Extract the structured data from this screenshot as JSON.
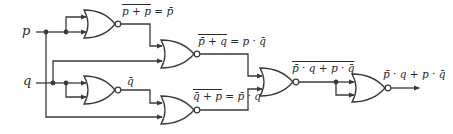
{
  "diagram": {
    "type": "logic-circuit",
    "gate_type": "NOR",
    "inputs": [
      {
        "id": "p",
        "label": "p"
      },
      {
        "id": "q",
        "label": "q"
      }
    ],
    "gates": [
      {
        "id": "g1",
        "label_overbar": "p + p",
        "label_rest": " = p̄",
        "inputs": [
          "p",
          "p"
        ]
      },
      {
        "id": "g3",
        "label_overbar": "",
        "label_rest": "q̄",
        "inputs": [
          "q",
          "q"
        ]
      },
      {
        "id": "g2",
        "label_overbar": "p̄ + q",
        "label_rest": " = p · q̄",
        "inputs": [
          "g1",
          "q"
        ]
      },
      {
        "id": "g4",
        "label_overbar": "q̄ + p",
        "label_rest": " = p̄ · q",
        "inputs": [
          "g3",
          "p"
        ]
      },
      {
        "id": "g5",
        "label_overbar": "p̄ · q + p · q̄",
        "label_rest": "",
        "inputs": [
          "g2",
          "g4"
        ]
      },
      {
        "id": "g6",
        "label_overbar": "",
        "label_rest": "p̄ · q + p · q̄",
        "inputs": [
          "g5",
          "g5"
        ]
      }
    ],
    "colors": {
      "line": "#3a3a3a",
      "text": "#2a2a2a",
      "background": "#ffffff"
    }
  }
}
